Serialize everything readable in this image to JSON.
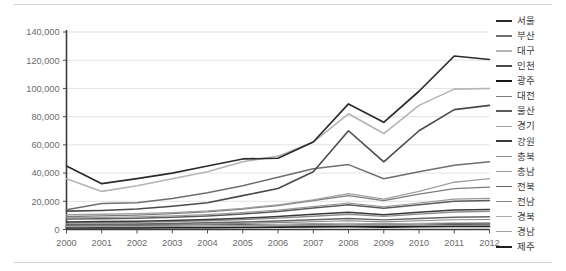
{
  "chart_data": {
    "type": "line",
    "title": "",
    "subtitle": "",
    "xlabel": "",
    "ylabel": "",
    "x": [
      2000,
      2001,
      2002,
      2003,
      2004,
      2005,
      2006,
      2007,
      2008,
      2009,
      2010,
      2011,
      2012
    ],
    "categories": [
      "2000",
      "2001",
      "2002",
      "2003",
      "2004",
      "2005",
      "2006",
      "2007",
      "2008",
      "2009",
      "2010",
      "2011",
      "2012"
    ],
    "xtick_labels": [
      "2000",
      "2001",
      "2002",
      "2003",
      "2004",
      "2005",
      "2006",
      "2007",
      "2008",
      "2009",
      "2010",
      "2011",
      "2012"
    ],
    "ytick_labels": [
      "0",
      "20,000",
      "40,000",
      "60,000",
      "80,000",
      "100,000",
      "120,000",
      "140,000"
    ],
    "ytick_values": [
      0,
      20000,
      40000,
      60000,
      80000,
      100000,
      120000,
      140000
    ],
    "ylim": [
      0,
      140000
    ],
    "grid": "horizontal",
    "legend_position": "right",
    "series": [
      {
        "name": "서울",
        "color": "#2b2b2b",
        "width": 1.7,
        "values": [
          45000,
          32500,
          36000,
          40000,
          45000,
          50000,
          50500,
          62000,
          89000,
          76000,
          98000,
          123000,
          120500
        ]
      },
      {
        "name": "부산",
        "color": "#6f6f6f",
        "width": 1.5,
        "values": [
          14000,
          18500,
          19000,
          22000,
          26000,
          31000,
          37000,
          43000,
          46000,
          36000,
          41000,
          45500,
          48000
        ]
      },
      {
        "name": "대구",
        "color": "#b4b4b4",
        "width": 1.6,
        "values": [
          36000,
          27000,
          31000,
          36000,
          41000,
          48000,
          52000,
          62000,
          82000,
          68000,
          88000,
          99500,
          100000
        ]
      },
      {
        "name": "인천",
        "color": "#4a4a4a",
        "width": 1.6,
        "values": [
          13000,
          13500,
          14500,
          16500,
          19000,
          24000,
          29000,
          41000,
          70000,
          48000,
          70000,
          85000,
          88000
        ]
      },
      {
        "name": "광주",
        "color": "#161616",
        "width": 1.9,
        "values": [
          2600,
          2700,
          2800,
          2900,
          3100,
          3200,
          3300,
          3500,
          3700,
          3500,
          3700,
          3900,
          4000
        ]
      },
      {
        "name": "대전",
        "color": "#7c7c7c",
        "width": 1.3,
        "values": [
          9200,
          9600,
          10200,
          11200,
          12500,
          14500,
          17000,
          20500,
          24000,
          20500,
          25000,
          29000,
          30000
        ]
      },
      {
        "name": "울산",
        "color": "#5a5a5a",
        "width": 1.5,
        "values": [
          7400,
          7600,
          8000,
          8700,
          9600,
          11000,
          12800,
          15200,
          17500,
          15000,
          17500,
          20000,
          20500
        ]
      },
      {
        "name": "경기",
        "color": "#a0a0a0",
        "width": 1.3,
        "values": [
          10500,
          10800,
          11200,
          12000,
          13200,
          15000,
          17500,
          21000,
          25500,
          21500,
          27000,
          33500,
          36000
        ]
      },
      {
        "name": "강원",
        "color": "#3a3a3a",
        "width": 1.5,
        "values": [
          5400,
          5600,
          5900,
          6400,
          7100,
          8000,
          9200,
          10800,
          12200,
          10500,
          12200,
          13800,
          14200
        ]
      },
      {
        "name": "충북",
        "color": "#8c8c8c",
        "width": 1.3,
        "values": [
          4600,
          4800,
          5100,
          5600,
          6200,
          7000,
          8000,
          9400,
          10800,
          9300,
          10900,
          12400,
          12800
        ]
      },
      {
        "name": "충남",
        "color": "#9a9a9a",
        "width": 1.2,
        "values": [
          8200,
          8500,
          8900,
          9600,
          10600,
          12000,
          13800,
          16200,
          18800,
          16000,
          18800,
          21500,
          22000
        ]
      },
      {
        "name": "전북",
        "color": "#646464",
        "width": 1.4,
        "values": [
          3600,
          3750,
          3950,
          4300,
          4750,
          5300,
          6000,
          6900,
          7800,
          6800,
          7800,
          8700,
          9000
        ]
      },
      {
        "name": "전남",
        "color": "#888888",
        "width": 1.2,
        "values": [
          3000,
          3100,
          3250,
          3500,
          3850,
          4300,
          4850,
          5500,
          6200,
          5400,
          6200,
          6900,
          7100
        ]
      },
      {
        "name": "경북",
        "color": "#ababab",
        "width": 1.2,
        "values": [
          2300,
          2380,
          2480,
          2650,
          2880,
          3150,
          3500,
          3900,
          4350,
          3850,
          4350,
          4800,
          4950
        ]
      },
      {
        "name": "경남",
        "color": "#9e9e9e",
        "width": 1.2,
        "values": [
          1900,
          1960,
          2040,
          2180,
          2360,
          2580,
          2850,
          3170,
          3530,
          3120,
          3530,
          3900,
          4020
        ]
      },
      {
        "name": "제주",
        "color": "#1f1f1f",
        "width": 1.8,
        "values": [
          1100,
          1140,
          1200,
          1280,
          1380,
          1500,
          1640,
          1800,
          1980,
          1760,
          1980,
          2180,
          2250
        ]
      }
    ]
  },
  "legend": {
    "items": [
      {
        "label": "서울"
      },
      {
        "label": "부산"
      },
      {
        "label": "대구"
      },
      {
        "label": "인천"
      },
      {
        "label": "광주"
      },
      {
        "label": "대전"
      },
      {
        "label": "울산"
      },
      {
        "label": "경기"
      },
      {
        "label": "강원"
      },
      {
        "label": "충북"
      },
      {
        "label": "충남"
      },
      {
        "label": "전북"
      },
      {
        "label": "전남"
      },
      {
        "label": "경북"
      },
      {
        "label": "경남"
      },
      {
        "label": "제주"
      }
    ]
  },
  "axes": {
    "y_label_color": "#6b6b6b",
    "x_label_color": "#6b6b6b",
    "axis_line_color": "#3c3c3c",
    "grid_color": "#dcdcdc"
  }
}
